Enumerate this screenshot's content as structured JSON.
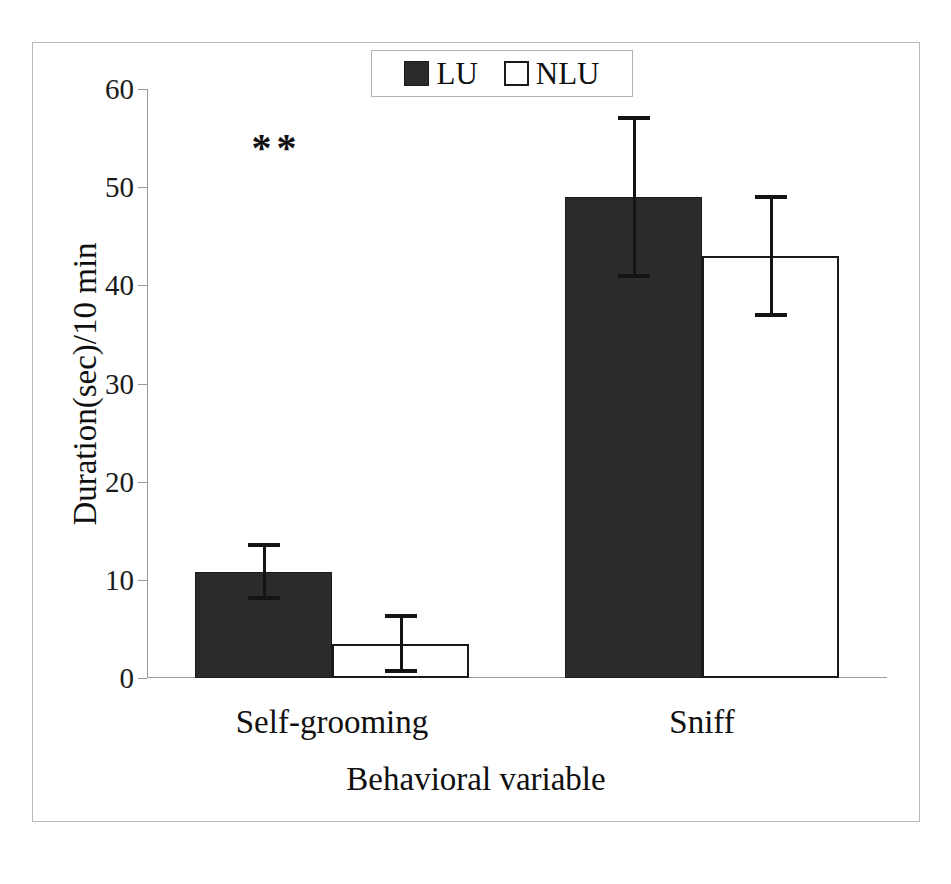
{
  "figure": {
    "background_color": "#ffffff",
    "frame_color": "#b9b9b9"
  },
  "legend": {
    "position": "top-center",
    "entries": [
      {
        "label": "LU",
        "swatch": "filled-square-icon",
        "color": "#2b2b2b"
      },
      {
        "label": "NLU",
        "swatch": "open-square-icon",
        "color": "#ffffff"
      }
    ]
  },
  "annotations": [
    {
      "text": "**",
      "category": "Self-grooming",
      "y_value": 54,
      "meaning": "significance-marker"
    }
  ],
  "axes": {
    "y_title": "Duration(sec)/10 min",
    "x_title": "Behavioral variable",
    "y_ticks": [
      0,
      10,
      20,
      30,
      40,
      50,
      60
    ],
    "y_tick_labels": [
      "0",
      "10",
      "20",
      "30",
      "40",
      "50",
      "60"
    ]
  },
  "chart_data": {
    "type": "bar",
    "title": "",
    "subtitle": "",
    "xlabel": "Behavioral variable",
    "ylabel": "Duration(sec)/10 min",
    "categories": [
      "Self-grooming",
      "Sniff"
    ],
    "ylim": [
      0,
      60
    ],
    "yticks": [
      0,
      10,
      20,
      30,
      40,
      50,
      60
    ],
    "grid": false,
    "legend_position": "top-center",
    "error_bars": "symmetric",
    "series": [
      {
        "name": "LU",
        "color": "#2b2b2b",
        "fill": "solid",
        "values": [
          10.8,
          49.0
        ],
        "errors": [
          2.7,
          8.0
        ]
      },
      {
        "name": "NLU",
        "color": "#ffffff",
        "fill": "open",
        "values": [
          3.5,
          43.0
        ],
        "errors": [
          2.8,
          6.0
        ]
      }
    ],
    "annotations": [
      {
        "text": "**",
        "category": "Self-grooming",
        "y_value": 54
      }
    ]
  }
}
